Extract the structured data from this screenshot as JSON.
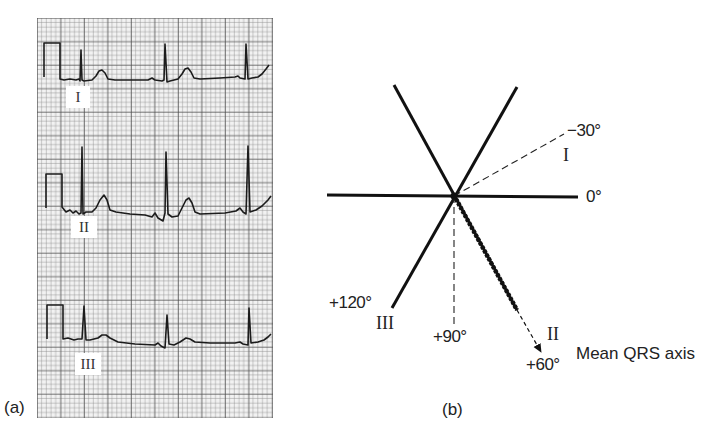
{
  "panel_a": {
    "label": "(a)",
    "grid": {
      "minor_color": "#9a9a9a",
      "major_color": "#555555",
      "background": "#f4f4f4"
    },
    "leads": [
      {
        "name": "I",
        "label": "I"
      },
      {
        "name": "II",
        "label": "II"
      },
      {
        "name": "III",
        "label": "III"
      }
    ],
    "trace_color": "#1e1e1e"
  },
  "panel_b": {
    "label": "(b)",
    "angles": {
      "minus30": "−30°",
      "zero": "0°",
      "plus60": "+60°",
      "plus90": "+90°",
      "plus120": "+120°"
    },
    "lead_labels": {
      "I": "I",
      "II": "II",
      "III": "III"
    },
    "mean_axis_caption": "Mean QRS axis",
    "mean_axis_degrees": 60
  }
}
